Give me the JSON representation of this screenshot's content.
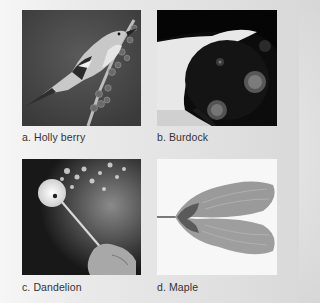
{
  "figure": {
    "panels": [
      {
        "id": "a",
        "caption": "a. Holly berry",
        "subject": "bird-eating-holly-berries"
      },
      {
        "id": "b",
        "caption": "b. Burdock",
        "subject": "dog-with-burdock-burrs"
      },
      {
        "id": "c",
        "caption": "c. Dandelion",
        "subject": "hand-blowing-dandelion-seeds"
      },
      {
        "id": "d",
        "caption": "d. Maple",
        "subject": "maple-samara-seed"
      }
    ]
  }
}
